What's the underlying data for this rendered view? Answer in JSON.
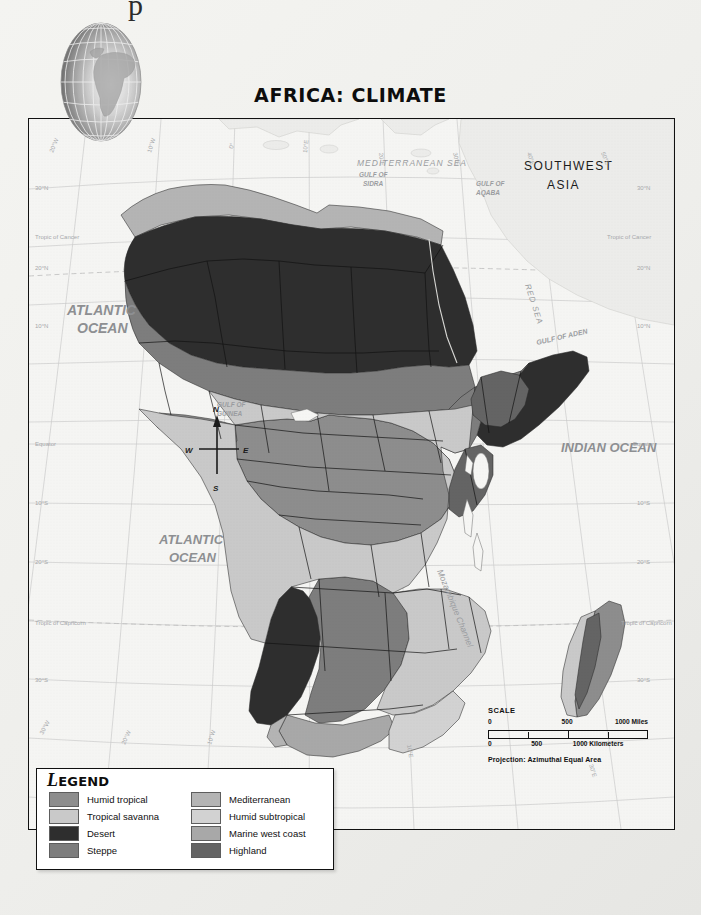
{
  "page": {
    "corner_mark": "p",
    "title": "AFRICA: CLIMATE"
  },
  "globe": {
    "name": "globe-inset-africa"
  },
  "map": {
    "ocean_labels": [
      {
        "id": "atlantic-north",
        "text_line1": "ATLANTIC",
        "text_line2": "OCEAN"
      },
      {
        "id": "atlantic-south",
        "text_line1": "ATLANTIC",
        "text_line2": "OCEAN"
      },
      {
        "id": "indian",
        "text_line1": "INDIAN  OCEAN",
        "text_line2": ""
      }
    ],
    "sea_labels": [
      {
        "id": "mediterranean-sea",
        "text": "MEDITERRANEAN SEA"
      },
      {
        "id": "red-sea",
        "text": "RED SEA"
      }
    ],
    "gulf_labels": [
      {
        "id": "gulf-of-sidra",
        "line1": "GULF OF",
        "line2": "SIDRA"
      },
      {
        "id": "gulf-of-aqaba",
        "line1": "GULF OF",
        "line2": "AQABA"
      },
      {
        "id": "gulf-of-aden",
        "line1": "GULF OF ADEN",
        "line2": ""
      },
      {
        "id": "gulf-of-guinea",
        "line1": "GULF OF",
        "line2": "GUINEA"
      }
    ],
    "land_labels": [
      {
        "id": "southwest-asia",
        "line1": "SOUTHWEST",
        "line2": "ASIA"
      }
    ],
    "channel_label": "Mozambique  Channel",
    "latitude_labels": [
      "30°N",
      "Tropic of Cancer",
      "20°N",
      "10°N",
      "Equator",
      "10°S",
      "20°S",
      "Tropic of Capricorn",
      "30°S",
      "40°S"
    ],
    "longitude_labels": [
      "20°W",
      "10°W",
      "0°",
      "10°E",
      "20°E",
      "30°E",
      "40°E",
      "50°E",
      "30°W",
      "20°W",
      "10°W",
      "0°",
      "10°E",
      "20°E",
      "30°E"
    ],
    "compass": {
      "north": "N",
      "south": "S",
      "east": "E",
      "west": "W"
    }
  },
  "scale": {
    "title": "SCALE",
    "miles": {
      "start": "0",
      "mid": "500",
      "end": "1000 Miles"
    },
    "kilometers": {
      "start": "0",
      "mid": "500",
      "end": "1000 Kilometers"
    },
    "projection": "Projection: Azimuthal Equal Area"
  },
  "legend": {
    "title_cap": "L",
    "title_rest": "EGEND",
    "items": [
      {
        "label": "Humid tropical",
        "color": "#8d8d8d"
      },
      {
        "label": "Mediterranean",
        "color": "#b4b4b4"
      },
      {
        "label": "Tropical savanna",
        "color": "#c9c9c9"
      },
      {
        "label": "Humid subtropical",
        "color": "#d2d2d2"
      },
      {
        "label": "Desert",
        "color": "#2e2e2e"
      },
      {
        "label": "Marine west coast",
        "color": "#a8a8a8"
      },
      {
        "label": "Steppe",
        "color": "#7d7d7d"
      },
      {
        "label": "Highland",
        "color": "#646464"
      }
    ]
  },
  "colors": {
    "humid_tropical": "#8d8d8d",
    "tropical_savanna": "#c9c9c9",
    "desert": "#2e2e2e",
    "steppe": "#7d7d7d",
    "mediterranean": "#b4b4b4",
    "humid_subtropical": "#d2d2d2",
    "marine_west_coast": "#a8a8a8",
    "highland": "#646464",
    "ocean": "#f2f2f0",
    "neighbor_land": "#ededea",
    "border": "#111111",
    "graticule": "#c8c8c8"
  }
}
